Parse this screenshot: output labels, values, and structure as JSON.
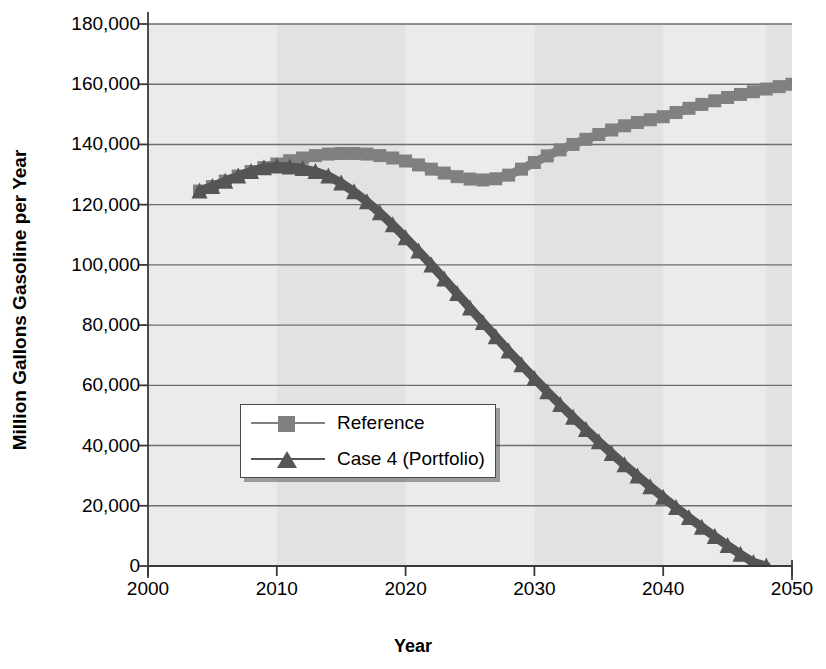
{
  "chart_data": {
    "type": "line",
    "title": "",
    "xlabel": "Year",
    "ylabel": "Million Gallons Gasoline per Year",
    "xlim": [
      2000,
      2050
    ],
    "ylim": [
      0,
      180000
    ],
    "xticks": [
      "2000",
      "2010",
      "2020",
      "2030",
      "2040",
      "2050"
    ],
    "yticks": [
      "0",
      "20,000",
      "40,000",
      "60,000",
      "80,000",
      "100,000",
      "120,000",
      "140,000",
      "160,000",
      "180,000"
    ],
    "grid": "horizontal",
    "legend_position": "center-left",
    "series": [
      {
        "name": "Reference",
        "marker": "square",
        "color": "#808080",
        "x": [
          2004,
          2005,
          2006,
          2007,
          2008,
          2009,
          2010,
          2011,
          2012,
          2013,
          2014,
          2015,
          2016,
          2017,
          2018,
          2019,
          2020,
          2021,
          2022,
          2023,
          2024,
          2025,
          2026,
          2027,
          2028,
          2029,
          2030,
          2031,
          2032,
          2033,
          2034,
          2035,
          2036,
          2037,
          2038,
          2039,
          2040,
          2041,
          2042,
          2043,
          2044,
          2045,
          2046,
          2047,
          2048,
          2049,
          2050
        ],
        "y": [
          124500,
          126000,
          127800,
          129500,
          131000,
          132300,
          133500,
          134600,
          135500,
          136300,
          136800,
          137000,
          137000,
          136800,
          136300,
          135500,
          134500,
          133200,
          131800,
          130500,
          129300,
          128500,
          128200,
          128600,
          129800,
          131800,
          134000,
          136200,
          138200,
          140000,
          141700,
          143300,
          144800,
          146200,
          147300,
          148200,
          149200,
          150600,
          152000,
          153300,
          154500,
          155600,
          156600,
          157500,
          158400,
          159200,
          160000
        ]
      },
      {
        "name": "Case 4 (Portfolio)",
        "marker": "triangle",
        "color": "#555555",
        "x": [
          2004,
          2005,
          2006,
          2007,
          2008,
          2009,
          2010,
          2011,
          2012,
          2013,
          2014,
          2015,
          2016,
          2017,
          2018,
          2019,
          2020,
          2021,
          2022,
          2023,
          2024,
          2025,
          2026,
          2027,
          2028,
          2029,
          2030,
          2031,
          2032,
          2033,
          2034,
          2035,
          2036,
          2037,
          2038,
          2039,
          2040,
          2041,
          2042,
          2043,
          2044,
          2045,
          2046,
          2047,
          2048
        ],
        "y": [
          124500,
          126000,
          127800,
          129500,
          131000,
          132300,
          132800,
          132500,
          132000,
          131000,
          129500,
          127200,
          124300,
          121000,
          117300,
          113300,
          109000,
          104600,
          100000,
          95300,
          90500,
          85700,
          80900,
          76100,
          71400,
          66800,
          62300,
          57900,
          53600,
          49400,
          45300,
          41300,
          37400,
          33600,
          29900,
          26300,
          22800,
          19400,
          16100,
          12900,
          9800,
          6800,
          3900,
          1200,
          0
        ]
      }
    ]
  },
  "axis_style": {
    "plot_bg": "#ebebeb",
    "band_bg": "#e2e2e2",
    "gridline_color": "#6e6e6e",
    "axis_color": "#3a3a3a"
  },
  "legend": {
    "items": [
      {
        "label": "Reference",
        "marker": "square",
        "color": "#808080"
      },
      {
        "label": "Case 4 (Portfolio)",
        "marker": "triangle",
        "color": "#555555"
      }
    ]
  }
}
